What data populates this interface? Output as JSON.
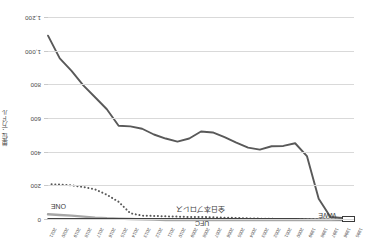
{
  "chart_data": {
    "type": "line",
    "title": "",
    "xlabel": "",
    "ylabel": "単位：万ドル",
    "ylim": [
      0,
      1200
    ],
    "y_ticks": [
      "0",
      "200",
      "400",
      "600",
      "800",
      "1,000",
      "1,200"
    ],
    "y_tick_values": [
      0,
      200,
      400,
      600,
      800,
      1000,
      1200
    ],
    "grid": true,
    "legend_position": "inline-labels",
    "x": [
      1995,
      1996,
      1997,
      1998,
      1999,
      2000,
      2001,
      2002,
      2003,
      2004,
      2005,
      2006,
      2007,
      2008,
      2009,
      2010,
      2011,
      2012,
      2013,
      2014,
      2015,
      2016,
      2017,
      2018,
      2019,
      2020,
      2021
    ],
    "categories": [
      "1995",
      "1996",
      "1997",
      "1998",
      "1999",
      "2000",
      "2001",
      "2002",
      "2003",
      "2004",
      "2005",
      "2006",
      "2007",
      "2008",
      "2009",
      "2010",
      "2011",
      "2012",
      "2013",
      "2014",
      "2015",
      "2016",
      "2017",
      "2018",
      "2019",
      "2020",
      "2021"
    ],
    "series": [
      {
        "name": "WWE",
        "style": "solid",
        "color": "#595959",
        "values": [
          8,
          12,
          18,
          126,
          380,
          456,
          440,
          438,
          418,
          430,
          460,
          492,
          520,
          526,
          484,
          466,
          484,
          508,
          542,
          556,
          560,
          658,
          729,
          800,
          886,
          960,
          1095
        ]
      },
      {
        "name": "UFC",
        "style": "dotted",
        "color": "#595959",
        "values": [
          2,
          2,
          3,
          4,
          5,
          6,
          6,
          7,
          8,
          10,
          12,
          14,
          16,
          18,
          18,
          20,
          22,
          24,
          26,
          40,
          108,
          150,
          182,
          196,
          206,
          210,
          214
        ]
      },
      {
        "name": "ONE",
        "style": "solid-light",
        "color": "#a6a6a6",
        "values": [
          0,
          0,
          0,
          0,
          0,
          0,
          0,
          0,
          0,
          0,
          0,
          0,
          0,
          0,
          0,
          0,
          0,
          2,
          4,
          6,
          8,
          10,
          14,
          20,
          26,
          30,
          34
        ]
      },
      {
        "name": "全日本プロレス",
        "style": "solid-thin",
        "color": "#404040",
        "values": [
          2,
          3,
          4,
          5,
          6,
          7,
          7,
          7,
          8,
          8,
          8,
          8,
          8,
          8,
          8,
          8,
          8,
          8,
          8,
          8,
          8,
          8,
          8,
          8,
          8,
          8,
          8
        ]
      }
    ],
    "annotations": [
      {
        "label": "WWE",
        "series": "WWE"
      },
      {
        "label": "UFC",
        "series": "UFC"
      },
      {
        "label": "ONE",
        "series": "ONE"
      },
      {
        "label": "全日本プロレス",
        "series": "全日本プロレス"
      }
    ]
  }
}
